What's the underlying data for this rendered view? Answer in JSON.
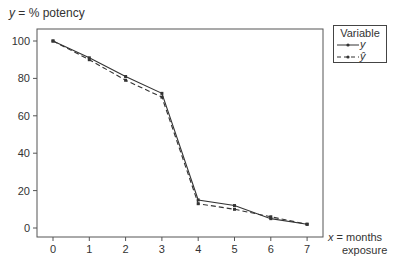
{
  "chart_data": {
    "type": "line",
    "title": "",
    "ylabel": "y = % potency",
    "xlabel": "x = months exposure",
    "x": [
      0,
      1,
      2,
      3,
      4,
      5,
      6,
      7
    ],
    "series": [
      {
        "name": "y",
        "style": "solid",
        "values": [
          100,
          91,
          81,
          72,
          15,
          12,
          5,
          2
        ]
      },
      {
        "name": "ŷ",
        "style": "dashed",
        "values": [
          100,
          90,
          79,
          70,
          13,
          10,
          6,
          2
        ]
      }
    ],
    "xlim": [
      -0.45,
      7.45
    ],
    "ylim": [
      -5,
      105
    ],
    "yticks": [
      0,
      20,
      40,
      60,
      80,
      100
    ],
    "xticks": [
      0,
      1,
      2,
      3,
      4,
      5,
      6,
      7
    ],
    "grid": false,
    "legend": {
      "title": "Variable",
      "position": "right-outside",
      "entries": [
        "y",
        "ŷ"
      ]
    }
  },
  "labels": {
    "y_axis_var": "y",
    "y_axis_rest": " = % potency",
    "x_axis_var": "x",
    "x_axis_rest": " = months",
    "x_axis_line2": "exposure",
    "legend_title": "Variable",
    "legend_y": "y",
    "legend_yhat": "ŷ"
  },
  "colors": {
    "line": "#333333",
    "axis": "#555555",
    "text": "#333333"
  }
}
